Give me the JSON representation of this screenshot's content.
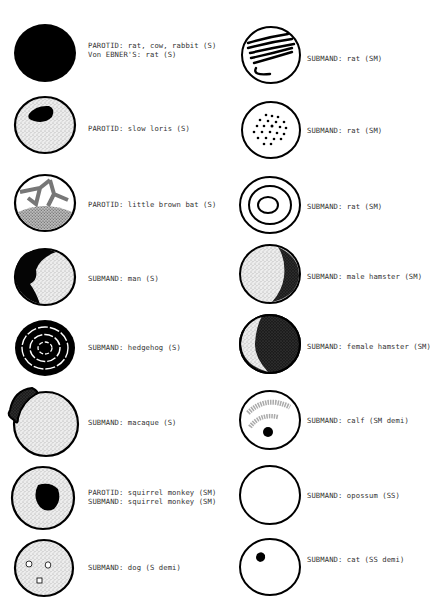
{
  "diagram": {
    "left_column": [
      {
        "id": "rat-cow-rabbit",
        "pattern": "solid-black",
        "lines": [
          "PAROTID: rat, cow, rabbit (S)",
          "Von EBNER'S: rat (S)"
        ]
      },
      {
        "id": "slow-loris",
        "pattern": "stipple-with-dark-patch",
        "lines": [
          "PAROTID: slow loris (S)"
        ]
      },
      {
        "id": "little-brown-bat",
        "pattern": "stipple-network",
        "lines": [
          "PAROTID: little brown bat (S)"
        ]
      },
      {
        "id": "man",
        "pattern": "stipple-dark-left-crescent",
        "lines": [
          "SUBMAND: man (S)"
        ]
      },
      {
        "id": "hedgehog",
        "pattern": "concentric-black-rings",
        "lines": [
          "SUBMAND: hedgehog (S)"
        ]
      },
      {
        "id": "macaque",
        "pattern": "stipple-dark-upper-left",
        "lines": [
          "SUBMAND: macaque (S)"
        ]
      },
      {
        "id": "squirrel-monkey",
        "pattern": "stipple-dark-center",
        "lines": [
          "PAROTID: squirrel monkey (SM)",
          "SUBMAND: squirrel monkey (SM)"
        ]
      },
      {
        "id": "dog",
        "pattern": "stipple-small-vacuoles",
        "lines": [
          "SUBMAND: dog (S demi)"
        ]
      }
    ],
    "right_column": [
      {
        "id": "rat-sm-1",
        "pattern": "wavy-lines",
        "lines": [
          "SUBMAND: rat (SM)"
        ]
      },
      {
        "id": "rat-sm-2",
        "pattern": "dots",
        "lines": [
          "SUBMAND: rat (SM)"
        ]
      },
      {
        "id": "rat-sm-3",
        "pattern": "concentric-rings",
        "lines": [
          "SUBMAND: rat (SM)"
        ]
      },
      {
        "id": "male-hamster",
        "pattern": "stipple-dark-right-crescent",
        "lines": [
          "SUBMAND: male hamster (SM)"
        ]
      },
      {
        "id": "female-hamster",
        "pattern": "dark-with-light-left-crescent",
        "lines": [
          "SUBMAND: female hamster (SM)"
        ]
      },
      {
        "id": "calf",
        "pattern": "light-arcs-with-dot",
        "lines": [
          "SUBMAND: calf (SM demi)"
        ]
      },
      {
        "id": "opossum",
        "pattern": "empty",
        "lines": [
          "SUBMAND: opossum (SS)"
        ]
      },
      {
        "id": "cat",
        "pattern": "empty-with-dot",
        "lines": [
          "SUBMAND: cat (SS demi)"
        ]
      }
    ]
  }
}
